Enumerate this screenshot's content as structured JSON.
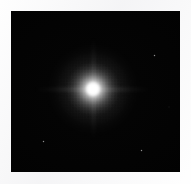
{
  "image": {
    "kind": "astronomical-point-source-image",
    "description": "Bright unresolved point source (stellar PSF) centered in a black sky field",
    "width": 191,
    "height": 184,
    "margin_color": "#f6f6f7",
    "sky_color": "#000000",
    "source_color": "#ffffff"
  },
  "frame": {
    "left": 11,
    "top": 11,
    "width": 169,
    "height": 161
  },
  "primary_source": {
    "name": "central-point-source",
    "center_x": 82,
    "center_y": 78,
    "core_diameter": 16,
    "halo_diameter": 54,
    "outer_halo_diameter": 96,
    "peak_color": "#ffffff"
  },
  "artifacts": {
    "horizontal_spike": {
      "center_x": 82,
      "center_y": 78,
      "length": 118,
      "thickness": 5
    },
    "vertical_spike": {
      "center_x": 82,
      "center_y": 78,
      "length": 104,
      "thickness": 5
    },
    "striation_grid": {
      "center_x": 82,
      "center_y": 78,
      "size": 74
    }
  },
  "field_sources": [
    {
      "name": "faint-source-upper-right",
      "x": 143,
      "y": 44,
      "size": 3
    },
    {
      "name": "faint-source-lower-left",
      "x": 32,
      "y": 130,
      "size": 3
    },
    {
      "name": "faint-source-lower-right",
      "x": 130,
      "y": 139,
      "size": 3
    },
    {
      "name": "faint-source-right-edge",
      "x": 158,
      "y": 96,
      "size": 2
    }
  ]
}
